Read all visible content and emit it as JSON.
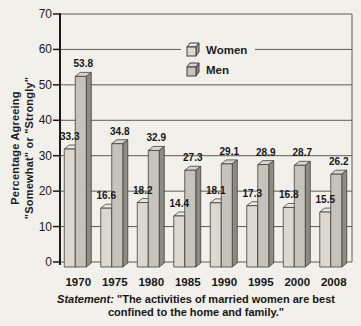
{
  "figure": {
    "y_axis_title_line1": "Percentage Agreeing",
    "y_axis_title_line2": "\"Somewhat\" or \"Strongly\"",
    "caption_label": "Statement:",
    "caption_text": "\"The activities of married women are best confined to the home and family.\""
  },
  "chart_data": {
    "type": "bar",
    "categories": [
      "1970",
      "1975",
      "1980",
      "1985",
      "1990",
      "1995",
      "2000",
      "2008"
    ],
    "series": [
      {
        "name": "Women",
        "values": [
          33.3,
          16.6,
          18.2,
          14.4,
          18.1,
          17.3,
          16.8,
          15.5
        ]
      },
      {
        "name": "Men",
        "values": [
          53.8,
          34.8,
          32.9,
          27.3,
          29.1,
          28.9,
          28.7,
          26.2
        ]
      }
    ],
    "title": "",
    "xlabel": "",
    "ylabel": "Percentage Agreeing \"Somewhat\" or \"Strongly\"",
    "ylim": [
      0,
      70
    ],
    "yticks": [
      0,
      10,
      20,
      30,
      40,
      50,
      60,
      70
    ],
    "grid": true,
    "legend_position": "top-center",
    "bar_style": "3d",
    "colors": {
      "women_front": "#dcd8cf",
      "women_side": "#a29e95",
      "women_top": "#e9e6de",
      "men_front": "#c6c3bb",
      "men_side": "#8e8b83",
      "men_top": "#d7d4cc",
      "outline": "#3f3f3f",
      "grid_line": "#5a5a5a",
      "axis_line": "#1a1a1a",
      "background": "#f2f0ea"
    }
  }
}
